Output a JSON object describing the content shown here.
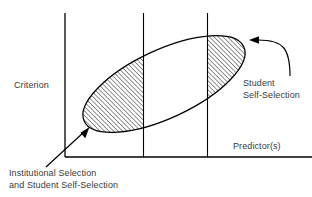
{
  "figure": {
    "type": "conceptual-scatter-ellipse-diagram",
    "background_color": "#ffffff",
    "line_color": "#000000",
    "text_color": "#3a3a3a"
  },
  "axes": {
    "y_axis_label": "Criterion",
    "x_axis_label": "Predictor(s)",
    "y_axis": {
      "x": 65,
      "y_top": 13,
      "y_bottom": 157
    },
    "x_axis": {
      "y": 157,
      "x_left": 65,
      "x_right": 312
    },
    "vertical_cut_lines": [
      {
        "name": "middle-cut-line",
        "x": 143,
        "y_top": 13,
        "y_bottom": 157
      },
      {
        "name": "right-cut-line",
        "x": 207,
        "y_top": 13,
        "y_bottom": 157
      }
    ]
  },
  "ellipse": {
    "name": "data-cloud-ellipse",
    "center_x": 164,
    "center_y": 84,
    "radius_x": 88,
    "radius_y": 34,
    "rotation_deg": -25,
    "description": "Rotated ellipse representing positive correlation between predictor(s) and criterion"
  },
  "hatched_regions": [
    {
      "name": "left-hatched-region",
      "label_ref": "institutional_selection",
      "x_from": 65,
      "x_to": 143,
      "hatch_angle_deg": 45,
      "hatch_spacing_px": 3
    },
    {
      "name": "right-hatched-region",
      "label_ref": "student_self_selection",
      "x_from": 207,
      "x_to": 252,
      "hatch_angle_deg": 45,
      "hatch_spacing_px": 3
    }
  ],
  "annotations": {
    "student_self_selection": {
      "line1": "Student",
      "line2": "Self-Selection",
      "arrow": {
        "name": "curved-arrow-right",
        "style": "curved",
        "points_to": "right-hatched-region"
      }
    },
    "institutional_selection": {
      "line1": "Institutional Selection",
      "line2": "and Student Self-Selection",
      "arrow": {
        "name": "straight-arrow-left",
        "style": "straight-diagonal",
        "points_to": "left-hatched-region"
      }
    }
  }
}
